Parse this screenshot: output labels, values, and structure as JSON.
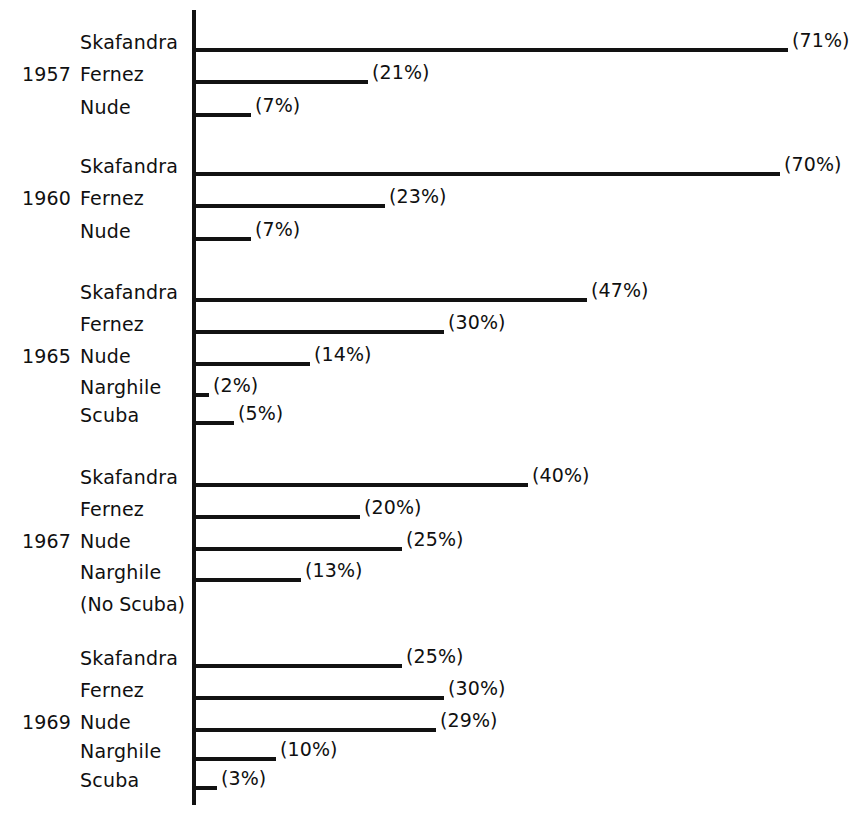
{
  "chart_data": {
    "type": "bar",
    "orientation": "horizontal",
    "title": "",
    "subtitle": "",
    "xlabel": "",
    "ylabel": "",
    "xlim": [
      0,
      75
    ],
    "grid": false,
    "legend": null,
    "value_label_format": "(N%)",
    "axis_color": "#121212",
    "bar_color": "#121212",
    "background_color": "#ffffff",
    "groups": [
      {
        "year": "1957",
        "categories": [
          "Skafandra",
          "Fernez",
          "Nude"
        ],
        "values": [
          71,
          21,
          7
        ],
        "labels": [
          "(71%)",
          "(21%)",
          "(7%)"
        ],
        "note": ""
      },
      {
        "year": "1960",
        "categories": [
          "Skafandra",
          "Fernez",
          "Nude"
        ],
        "values": [
          70,
          23,
          7
        ],
        "labels": [
          "(70%)",
          "(23%)",
          "(7%)"
        ],
        "note": ""
      },
      {
        "year": "1965",
        "categories": [
          "Skafandra",
          "Fernez",
          "Nude",
          "Narghile",
          "Scuba"
        ],
        "values": [
          47,
          30,
          14,
          2,
          5
        ],
        "labels": [
          "(47%)",
          "(30%)",
          "(14%)",
          "(2%)",
          "(5%)"
        ],
        "note": ""
      },
      {
        "year": "1967",
        "categories": [
          "Skafandra",
          "Fernez",
          "Nude",
          "Narghile"
        ],
        "values": [
          40,
          20,
          25,
          13
        ],
        "labels": [
          "(40%)",
          "(20%)",
          "(25%)",
          "(13%)"
        ],
        "note": "(No Scuba)"
      },
      {
        "year": "1969",
        "categories": [
          "Skafandra",
          "Fernez",
          "Nude",
          "Narghile",
          "Scuba"
        ],
        "values": [
          25,
          30,
          29,
          10,
          3
        ],
        "labels": [
          "(25%)",
          "(30%)",
          "(29%)",
          "(10%)",
          "(3%)"
        ],
        "note": ""
      }
    ]
  },
  "layout": {
    "axis_x": 192,
    "axis_top": 10,
    "axis_bottom": 805,
    "px_per_percent": 8.4,
    "label_left": 80,
    "year_left": 22,
    "rows": [
      {
        "group": 0,
        "index": 0,
        "y": 48
      },
      {
        "group": 0,
        "index": 1,
        "y": 80
      },
      {
        "group": 0,
        "index": 2,
        "y": 113
      },
      {
        "group": 1,
        "index": 0,
        "y": 172
      },
      {
        "group": 1,
        "index": 1,
        "y": 204
      },
      {
        "group": 1,
        "index": 2,
        "y": 237
      },
      {
        "group": 2,
        "index": 0,
        "y": 298
      },
      {
        "group": 2,
        "index": 1,
        "y": 330
      },
      {
        "group": 2,
        "index": 2,
        "y": 362
      },
      {
        "group": 2,
        "index": 3,
        "y": 393
      },
      {
        "group": 2,
        "index": 4,
        "y": 421
      },
      {
        "group": 3,
        "index": 0,
        "y": 483
      },
      {
        "group": 3,
        "index": 1,
        "y": 515
      },
      {
        "group": 3,
        "index": 2,
        "y": 547
      },
      {
        "group": 3,
        "index": 3,
        "y": 578
      },
      {
        "group": 4,
        "index": 0,
        "y": 664
      },
      {
        "group": 4,
        "index": 1,
        "y": 696
      },
      {
        "group": 4,
        "index": 2,
        "y": 728
      },
      {
        "group": 4,
        "index": 3,
        "y": 757
      },
      {
        "group": 4,
        "index": 4,
        "y": 786
      }
    ],
    "note_rows": [
      {
        "group": 3,
        "y": 610
      }
    ],
    "year_rows": [
      {
        "group": 0,
        "y": 80
      },
      {
        "group": 1,
        "y": 204
      },
      {
        "group": 2,
        "y": 362
      },
      {
        "group": 3,
        "y": 547
      },
      {
        "group": 4,
        "y": 728
      }
    ]
  }
}
